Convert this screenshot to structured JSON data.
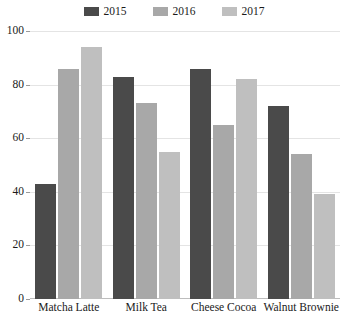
{
  "chart_data": {
    "type": "bar",
    "title": "",
    "subtitle": "",
    "xlabel": "",
    "ylabel": "",
    "ylim": [
      0,
      100
    ],
    "yticks": [
      0,
      20,
      40,
      60,
      80,
      100
    ],
    "grid": true,
    "legend_position": "top-center",
    "categories": [
      "Matcha Latte",
      "Milk Tea",
      "Cheese Cocoa",
      "Walnut Brownie"
    ],
    "series": [
      {
        "name": "2015",
        "color": "#4a4a4a",
        "values": [
          43,
          83,
          86,
          72
        ]
      },
      {
        "name": "2016",
        "color": "#a8a8a8",
        "values": [
          86,
          73,
          65,
          54
        ]
      },
      {
        "name": "2017",
        "color": "#bfbfbf",
        "values": [
          94,
          55,
          82,
          39
        ]
      }
    ]
  },
  "colors": {
    "gridline": "#e4e4e4",
    "axis": "#bdbdbd",
    "text": "#1a1a1a",
    "background": "#ffffff"
  }
}
